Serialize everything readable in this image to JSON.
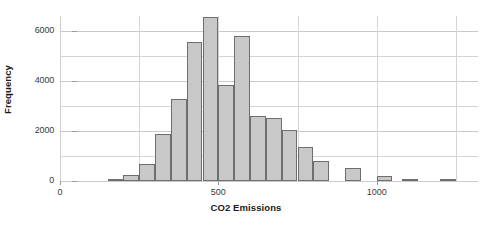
{
  "chart_data": {
    "type": "bar",
    "title": "",
    "subtitle": "",
    "xlabel": "CO2 Emissions",
    "ylabel": "Frequency",
    "xlim": [
      0,
      1320
    ],
    "ylim": [
      0,
      6600
    ],
    "grid": "both",
    "legend": "none",
    "bin_width": 50,
    "x_ticks": [
      {
        "value": 0,
        "label": "0"
      },
      {
        "value": 500,
        "label": "500"
      },
      {
        "value": 1000,
        "label": "1000"
      }
    ],
    "x_gridlines": [
      250,
      500,
      750,
      1000,
      1250
    ],
    "y_ticks": [
      {
        "value": 0,
        "label": "0",
        "major": true
      },
      {
        "value": 1000,
        "label": "",
        "major": false
      },
      {
        "value": 2000,
        "label": "2000",
        "major": true
      },
      {
        "value": 3000,
        "label": "",
        "major": false
      },
      {
        "value": 4000,
        "label": "4000",
        "major": true
      },
      {
        "value": 5000,
        "label": "",
        "major": false
      },
      {
        "value": 6000,
        "label": "6000",
        "major": true
      }
    ],
    "bar_fill": "#c8c8c8",
    "bar_stroke": "#6e6e6e",
    "grid_color": "#d4d4d4",
    "axis_color": "#b4b4b4",
    "bins": [
      {
        "x0": 150,
        "x1": 200,
        "value": 60
      },
      {
        "x0": 200,
        "x1": 250,
        "value": 260
      },
      {
        "x0": 250,
        "x1": 300,
        "value": 700
      },
      {
        "x0": 300,
        "x1": 350,
        "value": 1900
      },
      {
        "x0": 350,
        "x1": 400,
        "value": 3280
      },
      {
        "x0": 400,
        "x1": 450,
        "value": 5580
      },
      {
        "x0": 450,
        "x1": 500,
        "value": 6580
      },
      {
        "x0": 500,
        "x1": 550,
        "value": 3840
      },
      {
        "x0": 550,
        "x1": 600,
        "value": 5800
      },
      {
        "x0": 600,
        "x1": 650,
        "value": 2620
      },
      {
        "x0": 650,
        "x1": 700,
        "value": 2540
      },
      {
        "x0": 700,
        "x1": 750,
        "value": 2040
      },
      {
        "x0": 750,
        "x1": 800,
        "value": 1360
      },
      {
        "x0": 800,
        "x1": 850,
        "value": 820
      },
      {
        "x0": 900,
        "x1": 950,
        "value": 520
      },
      {
        "x0": 1000,
        "x1": 1050,
        "value": 200
      },
      {
        "x0": 1080,
        "x1": 1130,
        "value": 70
      },
      {
        "x0": 1200,
        "x1": 1250,
        "value": 60
      }
    ]
  }
}
